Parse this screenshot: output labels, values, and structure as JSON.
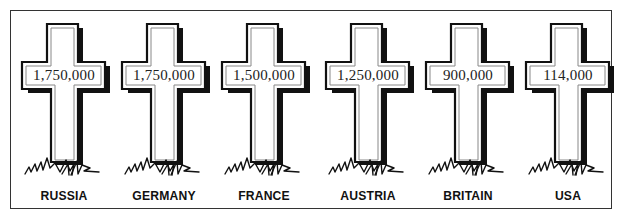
{
  "figure": {
    "items": [
      {
        "country": "RUSSIA",
        "deaths": "1,750,000"
      },
      {
        "country": "GERMANY",
        "deaths": "1,750,000"
      },
      {
        "country": "FRANCE",
        "deaths": "1,500,000"
      },
      {
        "country": "AUSTRIA",
        "deaths": "1,250,000"
      },
      {
        "country": "BRITAIN",
        "deaths": "900,000"
      },
      {
        "country": "USA",
        "deaths": "114,000"
      }
    ]
  },
  "colors": {
    "ink": "#111111",
    "background": "#ffffff",
    "inner_line": "#888888"
  }
}
